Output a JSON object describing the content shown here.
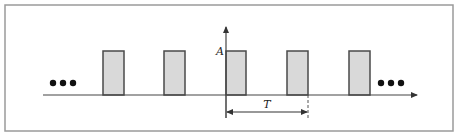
{
  "diagram": {
    "frame": {
      "x": 5,
      "y": 5,
      "width": 448,
      "height": 126,
      "stroke": "#9a9a9a"
    },
    "colors": {
      "axis": "#444444",
      "pulse_fill": "#d9d9d9",
      "pulse_stroke": "#4a4a4a",
      "dots": "#111111"
    },
    "axes": {
      "x_axis": {
        "x1": 43,
        "x2": 417,
        "y": 95
      },
      "y_axis": {
        "x": 226,
        "y1": 95,
        "y2": 27
      }
    },
    "amplitude_label": "A",
    "period_label": "T",
    "pulses": [
      {
        "x": 103,
        "width": 21
      },
      {
        "x": 164,
        "width": 21
      },
      {
        "x": 226,
        "width": 20
      },
      {
        "x": 287,
        "width": 21
      },
      {
        "x": 349,
        "width": 21
      }
    ],
    "pulse_top_y": 51,
    "baseline_y": 95,
    "continuation_left": {
      "label": "•••",
      "dots_x": [
        53,
        63,
        73
      ],
      "y": 83
    },
    "continuation_right": {
      "label": "•••",
      "dots_x": [
        381,
        391,
        401
      ],
      "y": 83
    },
    "period_marker": {
      "x_start": 226,
      "x_end": 308,
      "y": 112,
      "dashed_end_x": 308
    }
  }
}
